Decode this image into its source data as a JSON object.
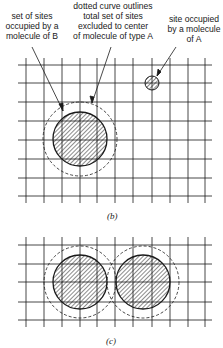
{
  "annotations": {
    "sites_b": "set of sites\noccupied by a\nmolecule of B",
    "dotted_curve": "dotted curve outlines\ntotal set of sites\nexcluded to center\nof molecule of type A",
    "site_a": "site occupied\nby a molecule\nof A"
  },
  "captions": {
    "b": "(b)",
    "c": "(c)"
  },
  "colors": {
    "ink": "#1a1a1a",
    "background": "#ffffff"
  }
}
